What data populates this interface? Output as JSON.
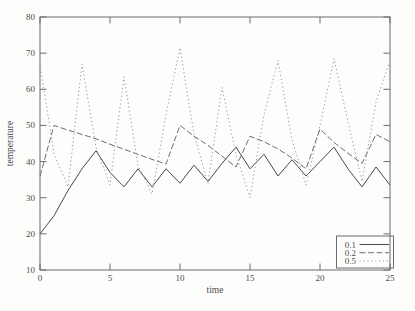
{
  "figure": {
    "background": "#fdfdfc",
    "frame_color": "#6b6b6b",
    "text_color": "#4d4d4d"
  },
  "chart_data": {
    "type": "line",
    "title": "",
    "xlabel": "time",
    "ylabel": "temperature",
    "xlim": [
      0,
      25
    ],
    "ylim": [
      10,
      80
    ],
    "xticks": [
      0,
      5,
      10,
      15,
      20,
      25
    ],
    "yticks": [
      10,
      20,
      30,
      40,
      50,
      60,
      70,
      80
    ],
    "grid": false,
    "x": [
      0,
      1,
      2,
      3,
      4,
      5,
      6,
      7,
      8,
      9,
      10,
      11,
      12,
      13,
      14,
      15,
      16,
      17,
      18,
      19,
      20,
      21,
      22,
      23,
      24,
      25
    ],
    "series": [
      {
        "name": "0.1",
        "style": "solid",
        "color": "#4a4a4a",
        "values": [
          20,
          25,
          32,
          38,
          43,
          37,
          33,
          38,
          33,
          38,
          34,
          39,
          34.5,
          39.5,
          44,
          38,
          42,
          36,
          40.5,
          36,
          40,
          44,
          38,
          33,
          38.5,
          33.5
        ]
      },
      {
        "name": "0.2",
        "style": "dashed",
        "color": "#6e6e6e",
        "values": [
          36,
          50,
          48.7,
          47.5,
          46.3,
          44.8,
          43.4,
          42,
          40.6,
          39.3,
          50,
          47,
          44.5,
          41.5,
          38.5,
          47,
          45.5,
          43.5,
          41,
          38,
          49,
          45.3,
          42.3,
          39.5,
          47.5,
          45.5
        ]
      },
      {
        "name": "0.5",
        "style": "dotted",
        "color": "#9b9b9b",
        "values": [
          67,
          42,
          33,
          67,
          44,
          33.5,
          63.5,
          39,
          31,
          53,
          71.5,
          47.5,
          34,
          60.5,
          42,
          30,
          53,
          68,
          46,
          33.5,
          50,
          68.5,
          51,
          34.5,
          56.5,
          68
        ]
      }
    ],
    "legend": {
      "position": "bottom-right",
      "box": true,
      "entries": [
        "0.1",
        "0.2",
        "0.5"
      ]
    }
  }
}
